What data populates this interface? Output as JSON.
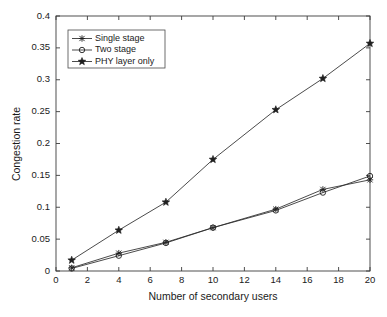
{
  "chart_data": {
    "type": "line",
    "title": "",
    "xlabel": "Number of secondary users",
    "ylabel": "Congestion rate",
    "xlim": [
      0,
      20
    ],
    "ylim": [
      0,
      0.4
    ],
    "grid": false,
    "legend_position": "upper-left",
    "x": [
      1,
      4,
      7,
      10,
      14,
      17,
      20
    ],
    "xticks": [
      "0",
      "2",
      "4",
      "6",
      "8",
      "10",
      "12",
      "14",
      "16",
      "18",
      "20"
    ],
    "xtick_values": [
      0,
      2,
      4,
      6,
      8,
      10,
      12,
      14,
      16,
      18,
      20
    ],
    "yticks": [
      "0",
      "0.05",
      "0.1",
      "0.15",
      "0.2",
      "0.25",
      "0.3",
      "0.35",
      "0.4"
    ],
    "ytick_values": [
      0,
      0.05,
      0.1,
      0.15,
      0.2,
      0.25,
      0.3,
      0.35,
      0.4
    ],
    "series": [
      {
        "name": "Single stage",
        "marker": "cross-icon",
        "color": "#2b2b2b",
        "values": [
          0.005,
          0.028,
          0.045,
          0.068,
          0.097,
          0.128,
          0.143
        ]
      },
      {
        "name": "Two stage",
        "marker": "circle-icon",
        "color": "#2b2b2b",
        "values": [
          0.004,
          0.024,
          0.044,
          0.068,
          0.095,
          0.123,
          0.149
        ]
      },
      {
        "name": "PHY layer only",
        "marker": "star-icon",
        "color": "#2b2b2b",
        "values": [
          0.017,
          0.064,
          0.108,
          0.175,
          0.253,
          0.302,
          0.357
        ]
      }
    ]
  }
}
